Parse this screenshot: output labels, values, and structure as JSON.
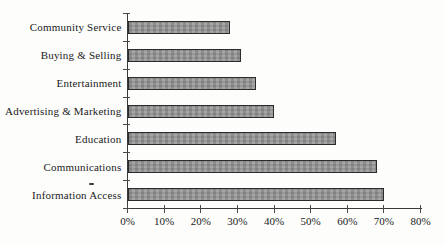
{
  "chart_data": {
    "type": "bar",
    "orientation": "horizontal",
    "title": "",
    "categories": [
      "Community Service",
      "Buying & Selling",
      "Entertainment",
      "Advertising & Marketing",
      "Education",
      "Communications",
      "Information Access"
    ],
    "values": [
      28,
      31,
      35,
      40,
      57,
      68,
      70
    ],
    "unit": "%",
    "xlabel": "",
    "ylabel": "",
    "xlim": [
      0,
      80
    ],
    "x_tick_step": 10,
    "x_tick_labels": [
      "0%",
      "10%",
      "20%",
      "30%",
      "40%",
      "50%",
      "60%",
      "70%",
      "80%"
    ],
    "grid": "off",
    "legend": "none",
    "bar_order_top_to_bottom": true
  },
  "colors": {
    "background": "#fdfdfc",
    "bar_fill": "#989898",
    "bar_border": "#2b2b2b",
    "axis": "#3a3a3a",
    "text": "#1b1b1b"
  },
  "artifacts": {
    "stray_dash_above_information_access": "-"
  }
}
